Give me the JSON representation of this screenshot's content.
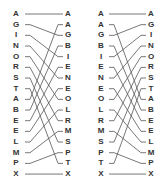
{
  "diagrams": [
    {
      "name": "merge-left",
      "left_column": [
        "A",
        "G",
        "I",
        "N",
        "O",
        "R",
        "S",
        "T",
        "A",
        "B",
        "E",
        "E",
        "L",
        "M",
        "P",
        "X"
      ],
      "right_column": [
        "A",
        "A",
        "G",
        "B",
        "I",
        "E",
        "N",
        "E",
        "O",
        "L",
        "R",
        "M",
        "S",
        "P",
        "T",
        "X"
      ],
      "connections": [
        [
          0,
          0
        ],
        [
          1,
          2
        ],
        [
          2,
          4
        ],
        [
          3,
          6
        ],
        [
          4,
          8
        ],
        [
          5,
          10
        ],
        [
          6,
          12
        ],
        [
          7,
          14
        ],
        [
          8,
          1
        ],
        [
          9,
          3
        ],
        [
          10,
          5
        ],
        [
          11,
          7
        ],
        [
          12,
          9
        ],
        [
          13,
          11
        ],
        [
          14,
          13
        ],
        [
          15,
          15
        ]
      ],
      "left_x": 16,
      "right_x": 68,
      "line_start": 25,
      "line_end": 63
    },
    {
      "name": "merge-right",
      "left_column": [
        "A",
        "A",
        "G",
        "B",
        "I",
        "E",
        "N",
        "E",
        "O",
        "L",
        "R",
        "M",
        "S",
        "P",
        "T",
        "X"
      ],
      "right_column": [
        "A",
        "G",
        "I",
        "N",
        "O",
        "R",
        "S",
        "T",
        "A",
        "B",
        "E",
        "E",
        "L",
        "M",
        "P",
        "X"
      ],
      "connections": [
        [
          0,
          0
        ],
        [
          2,
          1
        ],
        [
          4,
          2
        ],
        [
          6,
          3
        ],
        [
          8,
          4
        ],
        [
          10,
          5
        ],
        [
          12,
          6
        ],
        [
          14,
          7
        ],
        [
          1,
          8
        ],
        [
          3,
          9
        ],
        [
          5,
          10
        ],
        [
          7,
          11
        ],
        [
          9,
          12
        ],
        [
          11,
          13
        ],
        [
          13,
          14
        ],
        [
          15,
          15
        ]
      ],
      "left_x": 101,
      "right_x": 151,
      "line_start": 109,
      "line_end": 146
    }
  ],
  "layout": {
    "row_top": 14,
    "row_step": 10.67,
    "line_color": "#555555",
    "text_color": "#333333"
  }
}
